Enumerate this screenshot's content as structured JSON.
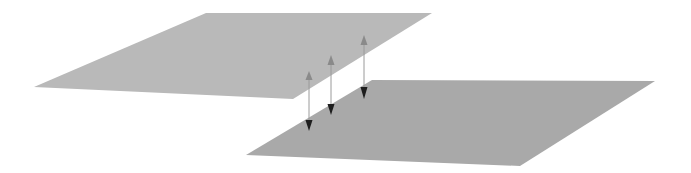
{
  "canvas": {
    "width": 691,
    "height": 173,
    "background": "#ffffff"
  },
  "colors": {
    "upper_plane": "#b9b9b9",
    "lower_plane": "#a9a9a9",
    "up_arrowhead": "#8a8a8a",
    "down_arrowhead": "#1e1e1e",
    "connector": "#9a9a9a"
  },
  "planes": [
    {
      "id": "upper-plane",
      "points": [
        [
          206,
          13
        ],
        [
          432,
          13
        ],
        [
          293,
          99
        ],
        [
          34,
          87
        ]
      ]
    },
    {
      "id": "lower-plane",
      "points": [
        [
          372,
          80
        ],
        [
          655,
          81
        ],
        [
          520,
          166
        ],
        [
          246,
          155
        ]
      ]
    }
  ],
  "arrows": [
    {
      "id": "arrow-1",
      "x": 309,
      "up_apex": 71,
      "up_base": 80,
      "down_base": 120,
      "down_apex": 131,
      "half_width": 3.5
    },
    {
      "id": "arrow-2",
      "x": 331,
      "up_apex": 55,
      "up_base": 65,
      "down_base": 104,
      "down_apex": 115,
      "half_width": 3.5
    },
    {
      "id": "arrow-3",
      "x": 364,
      "up_apex": 35,
      "up_base": 45,
      "down_base": 87,
      "down_apex": 99,
      "half_width": 3.5
    }
  ]
}
